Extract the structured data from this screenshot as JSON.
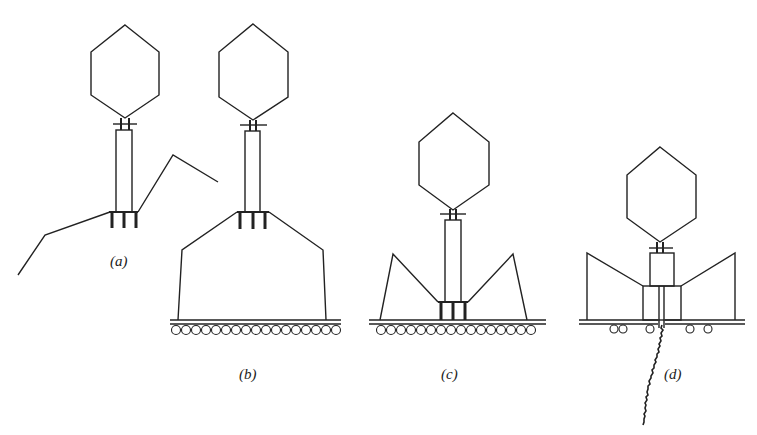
{
  "figure": {
    "colors": {
      "stroke": "#222222",
      "background": "#ffffff"
    },
    "panels": [
      {
        "id": "a",
        "label": "(a)",
        "label_pos": [
          110,
          253
        ]
      },
      {
        "id": "b",
        "label": "(b)",
        "label_pos": [
          239,
          366
        ]
      },
      {
        "id": "c",
        "label": "(c)",
        "label_pos": [
          441,
          366
        ]
      },
      {
        "id": "d",
        "label": "(d)",
        "label_pos": [
          664,
          366
        ]
      }
    ]
  }
}
